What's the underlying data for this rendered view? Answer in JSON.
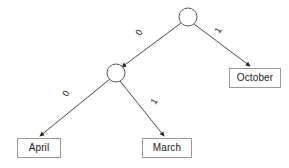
{
  "diagram": {
    "type": "decision-tree",
    "title": "",
    "background_color": "#ffffff",
    "line_color": "#4a4a4a",
    "box_border_color": "#9a9a9a",
    "text_color": "#1a1a1a",
    "nodes": [
      {
        "id": "root",
        "kind": "decision-circle",
        "label": "",
        "cx": 188,
        "cy": 17,
        "r": 9
      },
      {
        "id": "inner",
        "kind": "decision-circle",
        "label": "",
        "cx": 116,
        "cy": 73,
        "r": 9
      },
      {
        "id": "october",
        "kind": "leaf-box",
        "label": "October",
        "x": 229,
        "y": 68,
        "w": 52,
        "h": 20
      },
      {
        "id": "april",
        "kind": "leaf-box",
        "label": "April",
        "x": 17,
        "y": 138,
        "w": 44,
        "h": 20
      },
      {
        "id": "march",
        "kind": "leaf-box",
        "label": "March",
        "x": 142,
        "y": 138,
        "w": 50,
        "h": 20
      }
    ],
    "edges": [
      {
        "id": "root-to-inner",
        "from": "root",
        "to": "inner",
        "label": "0",
        "label_x": 140,
        "label_y": 32,
        "x1": 181,
        "y1": 23,
        "x2": 122,
        "y2": 67
      },
      {
        "id": "root-to-october",
        "from": "root",
        "to": "october",
        "label": "1",
        "label_x": 218,
        "label_y": 30,
        "x1": 194,
        "y1": 24,
        "x2": 250,
        "y2": 66
      },
      {
        "id": "inner-to-april",
        "from": "inner",
        "to": "april",
        "label": "0",
        "label_x": 67,
        "label_y": 93,
        "x1": 110,
        "y1": 79,
        "x2": 40,
        "y2": 136
      },
      {
        "id": "inner-to-march",
        "from": "inner",
        "to": "march",
        "label": "1",
        "label_x": 154,
        "label_y": 101,
        "x1": 120,
        "y1": 81,
        "x2": 164,
        "y2": 136
      }
    ]
  }
}
